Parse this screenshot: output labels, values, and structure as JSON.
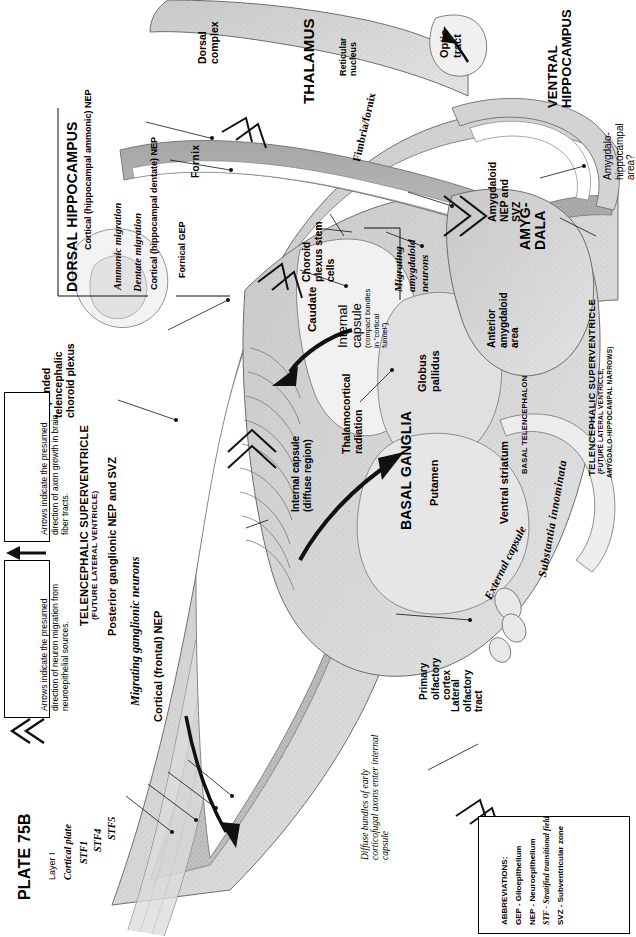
{
  "plate": {
    "number_label": "PLATE 75B"
  },
  "abbreviations": {
    "title": "ABBREVIATIONS:",
    "items": [
      "GEP - Glioepithelium",
      "NEP - Neuroepithelium",
      "STF - Stratified transitional field",
      "SVZ - Subventricular zone"
    ]
  },
  "legends": [
    {
      "id": "axon-growth",
      "arrow_style": "solid-line-arrow",
      "text": "Arrows indicate the presumed direction of axon growth in brain fiber tracts."
    },
    {
      "id": "neuron-migration",
      "arrow_style": "double-chevron-arrow",
      "text": "Arrows indicate the presumed direction of neuron migration from neuroepithelial sources."
    }
  ],
  "regions": {
    "thalamus": {
      "title": "THALAMUS",
      "dorsal_complex": "Dorsal complex",
      "reticular_nucleus": "Reticular nucleus",
      "optic_tract": "Optic tract"
    },
    "dorsal_hippocampus": {
      "title": "DORSAL HIPPOCAMPUS",
      "ammonic_nep": "Cortical (hippocampal ammonic) NEP",
      "ammonic_migration": "Ammonic migration",
      "dentate_migration": "Dentate migration",
      "dentate_nep": "Cortical (hippocampal dentate) NEP",
      "fornical_gep": "Fornical GEP",
      "fornix": "Fornix"
    },
    "ventral_hippocampus": {
      "title": "VENTRAL HIPPOCAMPUS",
      "amygdalo_hippocampal": "Amygdalo-hippocampal area?"
    },
    "amygdala": {
      "title": "AMYG-DALA",
      "nep_svz": "Amygdaloid NEP and SVZ",
      "anterior_area": "Anterior amygdaloid area",
      "migrating_neurons": "Migrating amygdaloid neurons"
    },
    "basal_ganglia": {
      "title": "BASAL GANGLIA",
      "putamen": "Putamen",
      "globus_pallidus": "Globus pallidus",
      "caudate": "Caudate",
      "ventral_striatum": "Ventral striatum",
      "external_capsule": "External capsule",
      "substantia_innominata": "Substantia innominata",
      "basal_telencephalon": "BASAL TELENCEPHALON"
    },
    "internal_capsule": {
      "title": "Internal capsule",
      "subtitle": "(compact bundles in \"cortical funnel\")",
      "diffuse": "Internal capsule (diffuse region)",
      "thalamocortical": "Thalamocortical radiation"
    },
    "superventricle": {
      "title_left": "TELENCEPHALIC SUPERVENTRICLE",
      "subtitle_left": "(FUTURE LATERAL VENTRICLE)",
      "title_right": "TELENCEPHALIC SUPERVENTRICLE",
      "subtitle_right_1": "(FUTURE LATERAL VENTRICLE,",
      "subtitle_right_2": "AMYGDALO-HIPPOCAMPAL NARROWS)"
    },
    "choroid": {
      "expanded_plexus": "Expanded telencephalic choroid plexus",
      "stem_cells": "Choroid plexus stem cells",
      "fimbria_fornix": "Fimbria/fornix"
    },
    "cortex": {
      "posterior_ganglionic": "Posterior ganglionic NEP and SVZ",
      "migrating_ganglionic": "Migrating ganglionic neurons",
      "cortical_frontal_nep": "Cortical (frontal) NEP",
      "diffuse_bundles": "Diffuse bundles of early corticofugal axons enter internal capsule",
      "primary_olfactory": "Primary olfactory cortex",
      "lateral_olfactory": "Lateral olfactory tract"
    },
    "cortical_layers": {
      "layer1": "Layer I",
      "cortical_plate": "Cortical plate",
      "stf1": "STF1",
      "stf4": "STF4",
      "stf5": "STF5"
    }
  }
}
